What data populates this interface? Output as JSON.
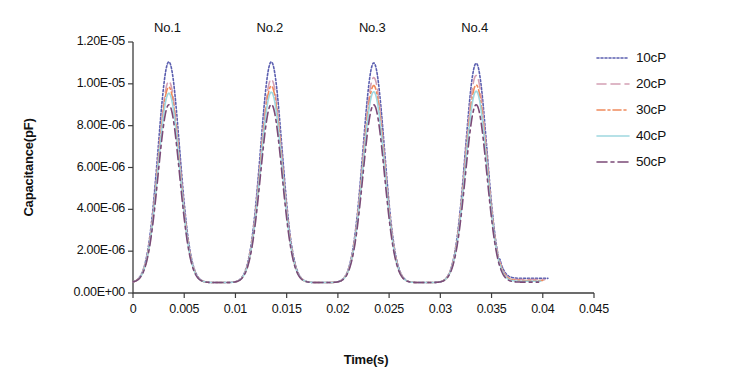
{
  "chart_data": {
    "type": "line",
    "title": "",
    "xlabel": "Time(s)",
    "ylabel": "Capacitance(pF)",
    "xlim": [
      0,
      0.045
    ],
    "ylim": [
      0,
      1.2e-05
    ],
    "xticks": [
      0,
      0.005,
      0.01,
      0.015,
      0.02,
      0.025,
      0.03,
      0.035,
      0.04,
      0.045
    ],
    "xtick_labels": [
      "0",
      "0.005",
      "0.01",
      "0.015",
      "0.02",
      "0.025",
      "0.03",
      "0.035",
      "0.04",
      "0.045"
    ],
    "yticks": [
      0,
      2e-06,
      4e-06,
      6e-06,
      8e-06,
      1e-05,
      1.2e-05
    ],
    "ytick_labels": [
      "0.00E+00",
      "2.00E-06",
      "4.00E-06",
      "6.00E-06",
      "8.00E-06",
      "1.00E-05",
      "1.20E-05"
    ],
    "grid": false,
    "legend_position": "right-outside",
    "baseline": 5e-07,
    "peak_centers": [
      0.0035,
      0.0135,
      0.0235,
      0.0335
    ],
    "peak_width_sigma": 0.00105,
    "data_end_x": [
      0.0405,
      0.0402,
      0.04,
      0.0398,
      0.0396
    ],
    "annotations": [
      {
        "text": "No.1",
        "x": 0.0042,
        "y": 1.28e-05
      },
      {
        "text": "No.2",
        "x": 0.0142,
        "y": 1.28e-05
      },
      {
        "text": "No.3",
        "x": 0.0242,
        "y": 1.28e-05
      },
      {
        "text": "No.4",
        "x": 0.0342,
        "y": 1.28e-05
      }
    ],
    "series": [
      {
        "name": "10cP",
        "color": "#5b5fb0",
        "dash": "2,2",
        "width": 1.6,
        "peak_values": [
          1.105e-05,
          1.105e-05,
          1.1e-05,
          1.098e-05
        ],
        "tail_value": 7e-07
      },
      {
        "name": "20cP",
        "color": "#d4a0b4",
        "dash": "9,5",
        "width": 1.6,
        "peak_values": [
          1.012e-05,
          1.022e-05,
          1.03e-05,
          1.04e-05
        ],
        "tail_value": 6.4e-07
      },
      {
        "name": "30cP",
        "color": "#ef8a5c",
        "dash": "8,3,2,3",
        "width": 1.6,
        "peak_values": [
          9.85e-06,
          9.9e-06,
          9.92e-06,
          9.95e-06
        ],
        "tail_value": 6e-07
      },
      {
        "name": "40cP",
        "color": "#9fd8e0",
        "dash": "none",
        "width": 1.6,
        "peak_values": [
          9.55e-06,
          9.6e-06,
          9.62e-06,
          9.65e-06
        ],
        "tail_value": 5.6e-07
      },
      {
        "name": "50cP",
        "color": "#7b4a77",
        "dash": "10,4,3,4",
        "width": 1.6,
        "peak_values": [
          9e-06,
          9.02e-06,
          9e-06,
          9e-06
        ],
        "tail_value": 5.2e-07
      }
    ]
  },
  "legend": {
    "items": [
      {
        "label": "10cP"
      },
      {
        "label": "20cP"
      },
      {
        "label": "30cP"
      },
      {
        "label": "40cP"
      },
      {
        "label": "50cP"
      }
    ]
  }
}
